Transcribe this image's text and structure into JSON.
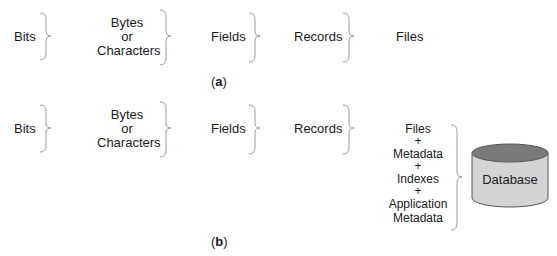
{
  "panel_a": {
    "items": [
      "Bits",
      "Bytes\nor\nCharacters",
      "Fields",
      "Records",
      "Files"
    ],
    "bits": "Bits",
    "bytes_line1": "Bytes",
    "bytes_line2": "or",
    "bytes_line3": "Characters",
    "fields": "Fields",
    "records": "Records",
    "files": "Files",
    "caption_open": "(",
    "caption_letter": "a",
    "caption_close": ")"
  },
  "panel_b": {
    "bits": "Bits",
    "bytes_line1": "Bytes",
    "bytes_line2": "or",
    "bytes_line3": "Characters",
    "fields": "Fields",
    "records": "Records",
    "stack": [
      "Files",
      "+",
      "Metadata",
      "+",
      "Indexes",
      "+",
      "Application",
      "Metadata"
    ],
    "database_label": "Database",
    "caption_open": "(",
    "caption_letter": "b",
    "caption_close": ")"
  },
  "colors": {
    "brace": "#9a9a9a",
    "cylinder_body": "#d4d4d4",
    "cylinder_top": "#7a7a7a",
    "cylinder_outline": "#555555"
  }
}
